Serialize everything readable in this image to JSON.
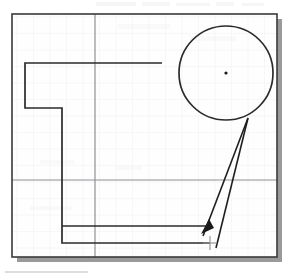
{
  "figure": {
    "kind": "scanned-cad-drawing",
    "width": 297,
    "height": 277,
    "background_color": "#ffffff",
    "paper_color": "#fefefe",
    "caption": ""
  },
  "canvas": {
    "label": "drawing-area",
    "border_color": "#3a3a3a",
    "border_width": 1.6,
    "x": 12,
    "y": 14,
    "width": 265,
    "height": 243,
    "shadow_color": "#9a9a9a",
    "shadow_offset": 5
  },
  "grid": {
    "minor_color": "#eceef0",
    "minor_spacing": 16.5,
    "major_color": "#8d9094",
    "major_width": 1.2,
    "major_vertical_x": 95,
    "major_horizontal_y": 180,
    "visible": true
  },
  "geometry": {
    "stroke_color": "#2b2b2b",
    "stroke_width": 1.7,
    "profile_label": "L-shaped-profile",
    "profile_points": "162,63 25,63 25,108 62,108 62,243 210,243",
    "inner_ledge_label": "inner-ledge-line",
    "inner_ledge_points": "62,226 206,226"
  },
  "circle": {
    "label": "detail-circle",
    "cx": 226,
    "cy": 73,
    "r": 47,
    "stroke_color": "#2b2b2b",
    "stroke_width": 1.7,
    "fill": "none",
    "center_dot_r": 1.6,
    "center_dot_color": "#1a1a1a"
  },
  "leader": {
    "label": "leader-annotation",
    "stroke_color": "#1f1f1f",
    "stroke_width": 1.6,
    "apex_x": 248,
    "apex_y": 118,
    "line_a_end_x": 203,
    "line_a_end_y": 236,
    "line_b_end_x": 216,
    "line_b_end_y": 248,
    "arrow_tip_x": 201,
    "arrow_tip_y": 234,
    "arrow_back1_x": 214,
    "arrow_back1_y": 228,
    "arrow_back2_x": 209,
    "arrow_back2_y": 219
  },
  "crosshair": {
    "label": "pick-point-crosshair",
    "x": 210,
    "y": 243,
    "size": 7,
    "color": "#8b8f93",
    "stroke_width": 1.1
  },
  "caption_rule": {
    "label": "caption-rule",
    "x": 5,
    "y": 272,
    "width": 83,
    "color": "#b9bcc0",
    "thickness": 1.2
  },
  "scan_artifacts": {
    "label": "scan-noise-band",
    "top_band_y": 3,
    "top_band_color": "#f1f1f1",
    "opacity": 0.55
  }
}
